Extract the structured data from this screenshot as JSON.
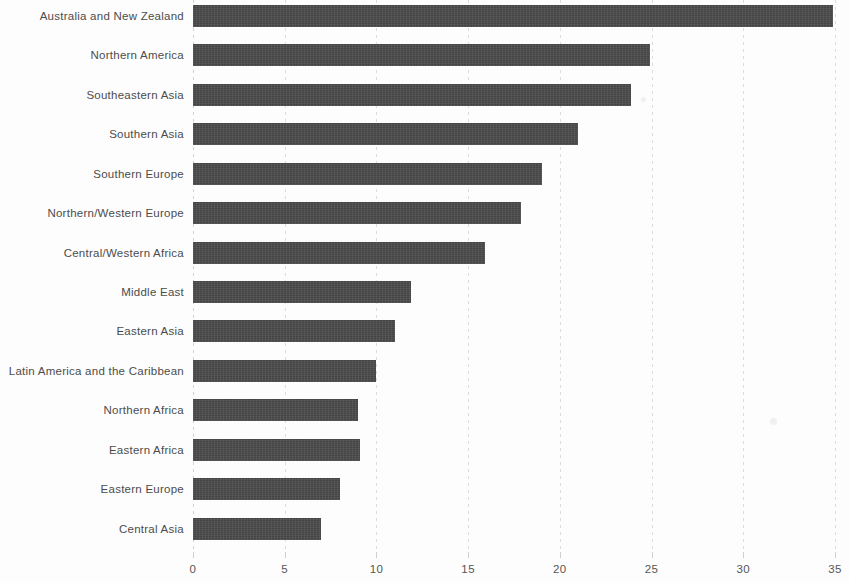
{
  "chart_data": {
    "type": "bar",
    "orientation": "horizontal",
    "title": "",
    "subtitle": "",
    "xlabel": "",
    "ylabel": "",
    "xlim": [
      0,
      35
    ],
    "xticks": [
      0,
      5,
      10,
      15,
      20,
      25,
      30,
      35
    ],
    "xtick_labels": [
      "0",
      "5",
      "10",
      "15",
      "20",
      "25",
      "30",
      "35"
    ],
    "grid": true,
    "grid_axis": "x",
    "legend": false,
    "bar_color": "#4b4b4b",
    "categories": [
      "Australia and New Zealand",
      "Northern America",
      "Southeastern Asia",
      "Southern Asia",
      "Southern Europe",
      "Northern/Western Europe",
      "Central/Western Africa",
      "Middle East",
      "Eastern Asia",
      "Latin America and the Caribbean",
      "Northern Africa",
      "Eastern Africa",
      "Eastern Europe",
      "Central Asia"
    ],
    "values": [
      34.9,
      24.9,
      23.9,
      21.0,
      19.0,
      17.9,
      15.9,
      11.9,
      11.0,
      10.0,
      9.0,
      9.1,
      8.0,
      7.0
    ]
  }
}
